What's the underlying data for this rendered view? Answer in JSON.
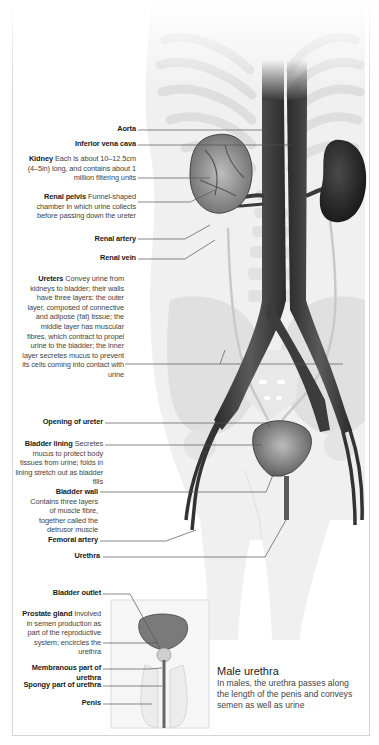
{
  "figure": {
    "colors": {
      "vessel": "#3a3a3a",
      "bone": "#dcdcdc",
      "body": "#efefef",
      "leader": "#555555"
    }
  },
  "labels": [
    {
      "id": "aorta",
      "term": "Aorta",
      "desc": ""
    },
    {
      "id": "ivc",
      "term": "Inferior vena cava",
      "desc": ""
    },
    {
      "id": "kidney",
      "term": "Kidney",
      "desc": "Each is about 10–12.5cm (4–5in) long, and contains about 1 million filtering units"
    },
    {
      "id": "renal-pelvis",
      "term": "Renal pelvis",
      "desc": "Funnel-shaped chamber in which urine collects before passing down the ureter"
    },
    {
      "id": "renal-artery",
      "term": "Renal artery",
      "desc": ""
    },
    {
      "id": "renal-vein",
      "term": "Renal vein",
      "desc": ""
    },
    {
      "id": "ureters",
      "term": "Ureters",
      "desc": "Convey urine from kidneys to bladder; their walls have three layers: the outer layer, composed of connective and adipose (fat) tissue; the middle layer has muscular fibres, which contract to propel urine to the bladder; the inner layer secretes mucus to prevent its cells coming into contact with urine"
    },
    {
      "id": "opening-ureter",
      "term": "Opening of ureter",
      "desc": ""
    },
    {
      "id": "bladder-lining",
      "term": "Bladder lining",
      "desc": "Secretes mucus to protect body tissues from urine; folds in lining stretch out as bladder fills"
    },
    {
      "id": "bladder-wall",
      "term": "Bladder wall",
      "desc": "Contains three layers of muscle fibre, together called the detrusor muscle"
    },
    {
      "id": "femoral-artery",
      "term": "Femoral artery",
      "desc": ""
    },
    {
      "id": "urethra",
      "term": "Urethra",
      "desc": ""
    },
    {
      "id": "bladder-outlet",
      "term": "Bladder outlet",
      "desc": ""
    },
    {
      "id": "prostate",
      "term": "Prostate gland",
      "desc": "Involved in semen production as part of the reproductive system; encircles the urethra"
    },
    {
      "id": "membranous",
      "term": "Membranous part of urethra",
      "desc": ""
    },
    {
      "id": "spongy",
      "term": "Spongy part of urethra",
      "desc": ""
    },
    {
      "id": "penis",
      "term": "Penis",
      "desc": ""
    }
  ],
  "inset": {
    "title": "Male urethra",
    "text": "In males, the urethra passes along the length of the penis and conveys  semen as well as urine"
  }
}
